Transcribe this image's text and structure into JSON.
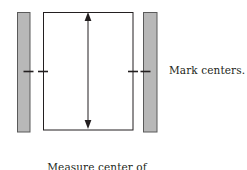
{
  "figure": {
    "type": "quilt-border-measurement-diagram",
    "background_color": "#ffffff",
    "ink_color": "#231f20",
    "bar_fill_color": "#b8b8b8",
    "bar_stroke_color": "#5a5a5a"
  },
  "labels": {
    "mark_centers": "Mark centers.",
    "caption_line_1": "Measure center of",
    "caption_line_2": "quilt, top to bottom."
  },
  "shapes": {
    "left_border_strip": {
      "x": 17,
      "y": 12,
      "width": 13,
      "height": 120
    },
    "right_border_strip": {
      "x": 143,
      "y": 12,
      "width": 14,
      "height": 120
    },
    "quilt_rectangle": {
      "x": 43,
      "y": 12,
      "width": 90,
      "height": 118
    },
    "measure_arrow": {
      "x": 88,
      "y_top": 13,
      "y_bottom": 128
    },
    "center_ticks": [
      {
        "name": "left-strip-tick",
        "x1": 24,
        "x2": 34,
        "y": 71
      },
      {
        "name": "quilt-left-tick",
        "x1": 38,
        "x2": 48,
        "y": 71
      },
      {
        "name": "quilt-right-tick",
        "x1": 128,
        "x2": 138,
        "y": 71
      },
      {
        "name": "right-strip-tick",
        "x1": 141,
        "x2": 151,
        "y": 71
      }
    ]
  }
}
